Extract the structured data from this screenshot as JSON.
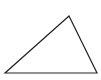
{
  "diagram": {
    "shape": "triangle",
    "vertices": [
      [
        69,
        16
      ],
      [
        5,
        73
      ],
      [
        97,
        73
      ]
    ],
    "stroke": "#222222",
    "fill": "none",
    "background": "#ffffff"
  }
}
